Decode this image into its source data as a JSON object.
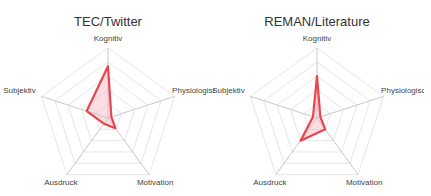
{
  "chart_data": [
    {
      "type": "radar",
      "title": "TEC/Twitter",
      "axes": [
        "Kognitiv",
        "Physiologisch",
        "Motivation",
        "Ausdruck",
        "Subjektiv"
      ],
      "values": [
        0.74,
        0.05,
        0.18,
        0.1,
        0.32
      ],
      "range": [
        0,
        1
      ],
      "grid_levels": 5,
      "grid": true
    },
    {
      "type": "radar",
      "title": "REMAN/Literature",
      "axes": [
        "Kognitiv",
        "Physiologisch",
        "Motivation",
        "Ausdruck",
        "Subjektiv"
      ],
      "values": [
        0.6,
        0.05,
        0.2,
        0.4,
        0.06
      ],
      "range": [
        0,
        1
      ],
      "grid_levels": 5,
      "grid": true
    }
  ],
  "style": {
    "line_color": "#e8454f",
    "fill_color": "#f4b6c2",
    "grid_color": "#e6e6e6",
    "axis_color": "#c8c8c8"
  }
}
